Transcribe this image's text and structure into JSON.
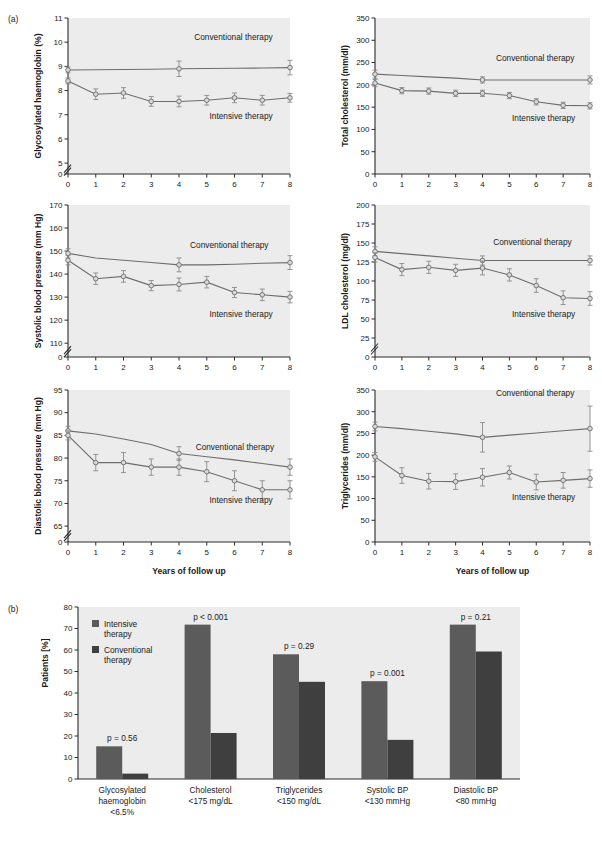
{
  "figure": {
    "panel_a_label": "(a)",
    "panel_b_label": "(b)",
    "caption": ""
  },
  "common": {
    "x_axis_title": "Years of follow up",
    "series_conventional": "Conventional therapy",
    "series_intensive": "Intensive therapy",
    "x_ticks": [
      "0",
      "1",
      "2",
      "3",
      "4",
      "5",
      "6",
      "7",
      "8"
    ]
  },
  "chart_data": [
    {
      "id": "glycosylated-haemoglobin",
      "type": "line",
      "title": "",
      "ylabel": "Glycosylated haemoglobin (%)",
      "xlabel": "Years of follow up",
      "x": [
        0,
        1,
        2,
        3,
        4,
        5,
        6,
        7,
        8
      ],
      "ylim": [
        4.55,
        11
      ],
      "y_ticks": [
        "0",
        "5",
        "6",
        "7",
        "8",
        "9",
        "10",
        "11"
      ],
      "y_tick_values": [
        4.55,
        5,
        6,
        7,
        8,
        9,
        10,
        11
      ],
      "axis_break": true,
      "grid": false,
      "legend_position": "inline-annotation",
      "series": [
        {
          "name": "Conventional therapy",
          "values": [
            8.85,
            8.86,
            8.87,
            8.88,
            8.9,
            8.91,
            8.92,
            8.93,
            8.95
          ],
          "errors": [
            0.12,
            0,
            0,
            0,
            0.32,
            0,
            0,
            0,
            0.3
          ],
          "marker_at": [
            0,
            4,
            8
          ],
          "label_xy": [
            4.55,
            10.1
          ]
        },
        {
          "name": "Intensive therapy",
          "values": [
            8.4,
            7.85,
            7.9,
            7.55,
            7.55,
            7.6,
            7.7,
            7.6,
            7.7
          ],
          "errors": [
            0.12,
            0.22,
            0.22,
            0.2,
            0.22,
            0.2,
            0.2,
            0.2,
            0.18
          ],
          "marker_at": [
            0,
            1,
            2,
            3,
            4,
            5,
            6,
            7,
            8
          ],
          "label_xy": [
            5.1,
            6.82
          ]
        }
      ]
    },
    {
      "id": "total-cholesterol",
      "type": "line",
      "ylabel": "Total cholesterol (mm/dl)",
      "xlabel": "Years of follow up",
      "x": [
        0,
        1,
        2,
        3,
        4,
        5,
        6,
        7,
        8
      ],
      "ylim": [
        0,
        350
      ],
      "y_ticks": [
        "0",
        "50",
        "100",
        "150",
        "200",
        "250",
        "300",
        "350"
      ],
      "y_tick_values": [
        0,
        50,
        100,
        150,
        200,
        250,
        300,
        350
      ],
      "axis_break": false,
      "grid": false,
      "series": [
        {
          "name": "Conventional therapy",
          "values": [
            224,
            221,
            218,
            215,
            211,
            211,
            211,
            211,
            211
          ],
          "errors": [
            9,
            0,
            0,
            0,
            7,
            0,
            0,
            0,
            9
          ],
          "marker_at": [
            0,
            4,
            8
          ],
          "label_xy": [
            4.5,
            253
          ]
        },
        {
          "name": "Intensive therapy",
          "values": [
            204,
            187,
            186,
            181,
            181,
            176,
            162,
            154,
            153
          ],
          "errors": [
            8,
            7,
            7,
            7,
            7,
            7,
            7,
            7,
            7
          ],
          "marker_at": [
            0,
            1,
            2,
            3,
            4,
            5,
            6,
            7,
            8
          ],
          "label_xy": [
            5.1,
            118
          ]
        }
      ]
    },
    {
      "id": "systolic-blood-pressure",
      "type": "line",
      "ylabel": "Systolic blood pressure (mm Hg)",
      "xlabel": "Years of follow up",
      "x": [
        0,
        1,
        2,
        3,
        4,
        5,
        6,
        7,
        8
      ],
      "ylim": [
        104,
        170
      ],
      "y_ticks": [
        "0",
        "110",
        "120",
        "130",
        "140",
        "150",
        "160",
        "170"
      ],
      "y_tick_values": [
        104,
        110,
        120,
        130,
        140,
        150,
        160,
        170
      ],
      "axis_break": true,
      "grid": false,
      "series": [
        {
          "name": "Conventional therapy",
          "values": [
            149,
            147,
            146,
            145,
            144,
            144,
            144.3,
            144.7,
            145
          ],
          "errors": [
            2,
            0,
            0,
            0,
            3,
            0,
            0,
            0,
            3
          ],
          "marker_at": [
            0,
            4,
            8
          ],
          "label_xy": [
            4.4,
            151.5
          ]
        },
        {
          "name": "Intensive therapy",
          "values": [
            146,
            138,
            139,
            135,
            135.5,
            136.5,
            132,
            131,
            130
          ],
          "errors": [
            2,
            2.5,
            2.5,
            2.2,
            2.8,
            2.5,
            2.2,
            2.5,
            2.5
          ],
          "marker_at": [
            0,
            1,
            2,
            3,
            4,
            5,
            6,
            7,
            8
          ],
          "label_xy": [
            5.1,
            121.5
          ]
        }
      ]
    },
    {
      "id": "ldl-cholesterol",
      "type": "line",
      "ylabel": "LDL cholesterol (mg/dl)",
      "xlabel": "Years of follow up",
      "x": [
        0,
        1,
        2,
        3,
        4,
        5,
        6,
        7,
        8
      ],
      "ylim": [
        0,
        200
      ],
      "y_ticks": [
        "0",
        "25",
        "50",
        "75",
        "100",
        "125",
        "150",
        "175",
        "200"
      ],
      "y_tick_values": [
        0,
        25,
        50,
        75,
        100,
        125,
        150,
        175,
        200
      ],
      "axis_break": true,
      "grid": false,
      "series": [
        {
          "name": "Conventional therapy",
          "values": [
            139,
            136,
            133,
            130,
            127,
            127,
            127,
            127,
            127
          ],
          "errors": [
            6,
            0,
            0,
            0,
            6,
            0,
            0,
            0,
            6
          ],
          "marker_at": [
            0,
            4,
            8
          ],
          "label_xy": [
            4.4,
            147
          ]
        },
        {
          "name": "Intensive therapy",
          "values": [
            131,
            115,
            118,
            114,
            117,
            108,
            94,
            78,
            77
          ],
          "errors": [
            6,
            8,
            8,
            8,
            9,
            8,
            9,
            9,
            9
          ],
          "marker_at": [
            0,
            1,
            2,
            3,
            4,
            5,
            6,
            7,
            8
          ],
          "label_xy": [
            5.1,
            52
          ]
        }
      ]
    },
    {
      "id": "diastolic-blood-pressure",
      "type": "line",
      "ylabel": "Diastolic blood pressure (mm Hg)",
      "xlabel": "Years of follow up",
      "x": [
        0,
        1,
        2,
        3,
        4,
        5,
        6,
        7,
        8
      ],
      "ylim": [
        61.5,
        95
      ],
      "y_ticks": [
        "0",
        "65",
        "70",
        "75",
        "80",
        "85",
        "90",
        "95"
      ],
      "y_tick_values": [
        61.5,
        65,
        70,
        75,
        80,
        85,
        90,
        95
      ],
      "axis_break": true,
      "grid": false,
      "series": [
        {
          "name": "Conventional therapy",
          "values": [
            86,
            85.3,
            84.2,
            83,
            81,
            80.3,
            79.6,
            78.8,
            78
          ],
          "errors": [
            1,
            0,
            0,
            0,
            1.5,
            0,
            0,
            0,
            1.8
          ],
          "marker_at": [
            0,
            4,
            8
          ],
          "label_xy": [
            4.6,
            81.8
          ]
        },
        {
          "name": "Intensive therapy",
          "values": [
            85,
            79,
            79,
            78,
            78,
            77,
            75,
            73,
            73
          ],
          "errors": [
            1,
            1.8,
            2.2,
            1.8,
            1.8,
            2.2,
            2.2,
            2,
            2
          ],
          "marker_at": [
            0,
            1,
            2,
            3,
            4,
            5,
            6,
            7,
            8
          ],
          "label_xy": [
            5.1,
            70.2
          ]
        }
      ]
    },
    {
      "id": "triglycerides",
      "type": "line",
      "ylabel": "Triglycerides (mm/dl)",
      "xlabel": "Years of follow up",
      "x": [
        0,
        1,
        2,
        3,
        4,
        5,
        6,
        7,
        8
      ],
      "ylim": [
        0,
        350
      ],
      "y_ticks": [
        "0",
        "50",
        "100",
        "150",
        "200",
        "250",
        "300",
        "350"
      ],
      "y_tick_values": [
        0,
        50,
        100,
        150,
        200,
        250,
        300,
        350
      ],
      "axis_break": false,
      "grid": false,
      "series": [
        {
          "name": "Conventional therapy",
          "values": [
            266,
            261,
            255,
            249,
            241,
            246,
            251,
            256,
            261
          ],
          "errors": [
            10,
            0,
            0,
            0,
            34,
            0,
            0,
            0,
            52
          ],
          "marker_at": [
            0,
            4,
            8
          ],
          "label_xy": [
            4.5,
            337
          ]
        },
        {
          "name": "Intensive therapy",
          "values": [
            196,
            153,
            140,
            139,
            149,
            160,
            138,
            142,
            146
          ],
          "errors": [
            10,
            18,
            18,
            18,
            20,
            15,
            18,
            18,
            20
          ],
          "marker_at": [
            0,
            1,
            2,
            3,
            4,
            5,
            6,
            7,
            8
          ],
          "label_xy": [
            5.1,
            96
          ]
        }
      ]
    },
    {
      "id": "patients-reaching-target",
      "type": "bar",
      "ylabel": "Patients [%]",
      "xlabel": "",
      "ylim": [
        0,
        80
      ],
      "y_ticks": [
        "0",
        "10",
        "20",
        "30",
        "40",
        "50",
        "60",
        "70",
        "80"
      ],
      "y_tick_values": [
        0,
        10,
        20,
        30,
        40,
        50,
        60,
        70,
        80
      ],
      "grid": false,
      "legend_position": "top-left",
      "legend": [
        "Intensive therapy",
        "Conventional therapy"
      ],
      "categories": [
        "Glycosylated haemoglobin <6.5%",
        "Cholesterol <175 mg/dL",
        "Triglycerides <150 mg/dL",
        "Systolic BP <130 mmHg",
        "Diastolic BP <80 mmHg"
      ],
      "category_lines": [
        [
          "Glycosylated",
          "haemoglobin",
          "<6.5%"
        ],
        [
          "Cholesterol",
          "<175 mg/dL"
        ],
        [
          "Triglycerides",
          "<150 mg/dL"
        ],
        [
          "Systolic BP",
          "<130 mmHg"
        ],
        [
          "Diastolic BP",
          "<80 mmHg"
        ]
      ],
      "series": [
        {
          "name": "Intensive therapy",
          "values": [
            15.2,
            71.8,
            58,
            45.5,
            71.8
          ]
        },
        {
          "name": "Conventional therapy",
          "values": [
            2.5,
            21.4,
            45.2,
            18.2,
            59.3
          ]
        }
      ],
      "annotations": [
        {
          "text": "p = 0.56",
          "category": 0
        },
        {
          "text": "p < 0.001",
          "category": 1
        },
        {
          "text": "p = 0.29",
          "category": 2
        },
        {
          "text": "p = 0.001",
          "category": 3
        },
        {
          "text": "p = 0.21",
          "category": 4
        }
      ]
    }
  ],
  "colors": {
    "plot_background": "#ececec",
    "axis": "#2b2b2b",
    "line": "#6d6d6d",
    "marker_fill": "#d8d8d8",
    "bar_intensive": "#5b5b5b",
    "bar_conventional": "#3f3f3f"
  }
}
